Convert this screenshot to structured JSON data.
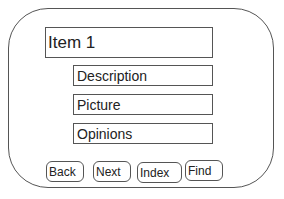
{
  "item": {
    "title": "Item 1"
  },
  "fields": [
    {
      "label": "Description"
    },
    {
      "label": "Picture"
    },
    {
      "label": "Opinions"
    }
  ],
  "buttons": [
    {
      "label": "Back"
    },
    {
      "label": "Next"
    },
    {
      "label": "Index"
    },
    {
      "label": "Find"
    }
  ]
}
